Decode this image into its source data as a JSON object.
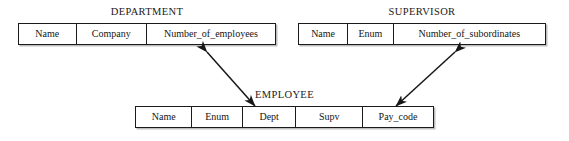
{
  "diagram": {
    "type": "entity-attribute-reference-diagram",
    "background_color": "#ffffff",
    "line_color": "#1b1b1b",
    "entities": [
      {
        "id": "department",
        "title": "DEPARTMENT",
        "attributes": [
          {
            "label": "Name",
            "width_pct": 22.5
          },
          {
            "label": "Company",
            "width_pct": 27.5
          },
          {
            "label": "Number_of_employees",
            "width_pct": 50.0
          }
        ]
      },
      {
        "id": "supervisor",
        "title": "SUPERVISOR",
        "attributes": [
          {
            "label": "Name",
            "width_pct": 20.0
          },
          {
            "label": "Enum",
            "width_pct": 18.5
          },
          {
            "label": "Number_of_subordinates",
            "width_pct": 61.5
          }
        ]
      },
      {
        "id": "employee",
        "title": "EMPLOYEE",
        "attributes": [
          {
            "label": "Name",
            "width_pct": 19.0
          },
          {
            "label": "Enum",
            "width_pct": 17.0
          },
          {
            "label": "Dept",
            "width_pct": 18.0
          },
          {
            "label": "Supv",
            "width_pct": 22.5
          },
          {
            "label": "Pay_code",
            "width_pct": 23.5
          }
        ]
      }
    ],
    "links": [
      {
        "id": "department-employee-link",
        "name": "department-to-employee-arrow",
        "from": "DEPARTMENT.Number_of_employees",
        "to": "EMPLOYEE.Dept",
        "arrowheads": "double",
        "x1": 207,
        "y1": 52,
        "x2": 255,
        "y2": 106
      },
      {
        "id": "supervisor-employee-link",
        "name": "supervisor-to-employee-arrow",
        "from": "SUPERVISOR.Number_of_subordinates",
        "to": "EMPLOYEE.Pay_code",
        "arrowheads": "double",
        "x1": 455,
        "y1": 52,
        "x2": 396,
        "y2": 106
      }
    ]
  }
}
